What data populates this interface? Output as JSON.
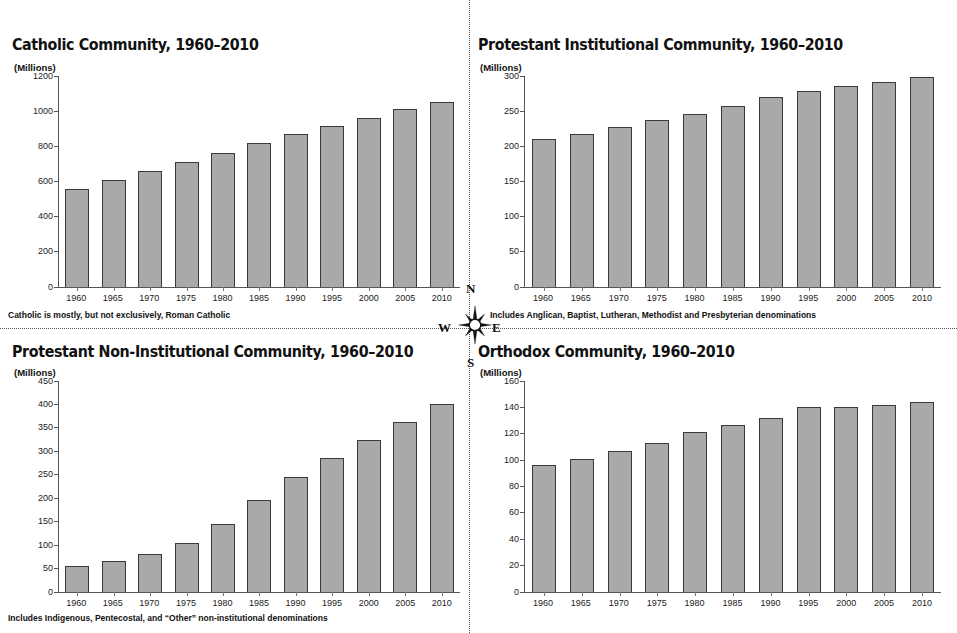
{
  "compass": {
    "north": "N",
    "south": "S",
    "east": "E",
    "west": "W",
    "icon": "compass-rose-icon"
  },
  "style": {
    "bar_fill": "#a9a9a9",
    "bar_border": "#3a3a3a",
    "axis_color": "#555555",
    "text_color": "#111111",
    "background": "#ffffff"
  },
  "panels": {
    "top_left": {
      "title": "Catholic Community, 1960–2010",
      "units": "(Millions)",
      "footnote": "Catholic is mostly, but not exclusively, Roman Catholic"
    },
    "top_right": {
      "title": "Protestant Institutional Community, 1960–2010",
      "units": "(Millions)",
      "footnote": "Includes Anglican, Baptist, Lutheran, Methodist and Presbyterian denominations"
    },
    "bottom_left": {
      "title": "Protestant Non-Institutional Community, 1960–2010",
      "units": "(Millions)",
      "footnote": "Includes Indigenous, Pentecostal, and “Other” non-institutional denominations"
    },
    "bottom_right": {
      "title": "Orthodox Community, 1960–2010",
      "units": "(Millions)",
      "footnote": ""
    }
  },
  "chart_data": [
    {
      "id": "catholic",
      "type": "bar",
      "title": "Catholic Community, 1960–2010",
      "xlabel": "",
      "ylabel": "(Millions)",
      "ylim": [
        0,
        1200
      ],
      "yticks": [
        0,
        200,
        400,
        600,
        800,
        1000,
        1200
      ],
      "grid": false,
      "legend": null,
      "categories": [
        "1960",
        "1965",
        "1970",
        "1975",
        "1980",
        "1985",
        "1990",
        "1995",
        "2000",
        "2005",
        "2010"
      ],
      "values": [
        560,
        610,
        660,
        713,
        762,
        818,
        872,
        917,
        963,
        1011,
        1053
      ],
      "annotation": "Catholic is mostly, but not exclusively, Roman Catholic"
    },
    {
      "id": "protestant-institutional",
      "type": "bar",
      "title": "Protestant Institutional Community, 1960–2010",
      "xlabel": "",
      "ylabel": "(Millions)",
      "ylim": [
        0,
        300
      ],
      "yticks": [
        0,
        50,
        100,
        150,
        200,
        250,
        300
      ],
      "grid": false,
      "legend": null,
      "categories": [
        "1960",
        "1965",
        "1970",
        "1975",
        "1980",
        "1985",
        "1990",
        "1995",
        "2000",
        "2005",
        "2010"
      ],
      "values": [
        211,
        218,
        228,
        237,
        246,
        257,
        270,
        279,
        286,
        292,
        298
      ],
      "annotation": "Includes Anglican, Baptist, Lutheran, Methodist and Presbyterian denominations"
    },
    {
      "id": "protestant-non-institutional",
      "type": "bar",
      "title": "Protestant Non-Institutional Community, 1960–2010",
      "xlabel": "",
      "ylabel": "(Millions)",
      "ylim": [
        0,
        450
      ],
      "yticks": [
        0,
        50,
        100,
        150,
        200,
        250,
        300,
        350,
        400,
        450
      ],
      "grid": false,
      "legend": null,
      "categories": [
        "1960",
        "1965",
        "1970",
        "1975",
        "1980",
        "1985",
        "1990",
        "1995",
        "2000",
        "2005",
        "2010"
      ],
      "values": [
        55,
        66,
        82,
        105,
        146,
        196,
        245,
        286,
        324,
        363,
        401
      ],
      "annotation": "Includes Indigenous, Pentecostal, and “Other” non-institutional denominations"
    },
    {
      "id": "orthodox",
      "type": "bar",
      "title": "Orthodox Community, 1960–2010",
      "xlabel": "",
      "ylabel": "(Millions)",
      "ylim": [
        0,
        160
      ],
      "yticks": [
        0,
        20,
        40,
        60,
        80,
        100,
        120,
        140,
        160
      ],
      "grid": false,
      "legend": null,
      "categories": [
        "1960",
        "1965",
        "1970",
        "1975",
        "1980",
        "1985",
        "1990",
        "1995",
        "2000",
        "2005",
        "2010"
      ],
      "values": [
        96,
        101,
        107,
        113,
        121,
        127,
        132,
        140,
        140,
        142,
        144
      ],
      "annotation": ""
    }
  ]
}
